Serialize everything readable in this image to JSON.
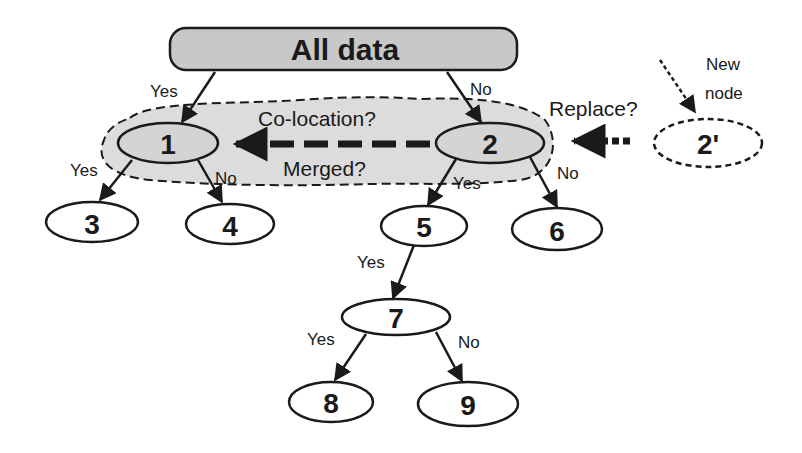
{
  "diagram": {
    "type": "decision-tree",
    "colors": {
      "root_fill": "#c8c8c8",
      "cloud_fill": "#dcdcdc",
      "node_fill_shaded": "#d4d4d4",
      "node_fill": "#ffffff",
      "stroke": "#1a1a1a"
    },
    "root": {
      "label": "All data"
    },
    "nodes": [
      {
        "id": "1",
        "label": "1"
      },
      {
        "id": "2",
        "label": "2"
      },
      {
        "id": "3",
        "label": "3"
      },
      {
        "id": "4",
        "label": "4"
      },
      {
        "id": "5",
        "label": "5"
      },
      {
        "id": "6",
        "label": "6"
      },
      {
        "id": "7",
        "label": "7"
      },
      {
        "id": "8",
        "label": "8"
      },
      {
        "id": "9",
        "label": "9"
      },
      {
        "id": "2prime",
        "label": "2'"
      }
    ],
    "edges": [
      {
        "from": "root",
        "to": "1",
        "label": "Yes"
      },
      {
        "from": "root",
        "to": "2",
        "label": "No"
      },
      {
        "from": "1",
        "to": "3",
        "label": "Yes"
      },
      {
        "from": "1",
        "to": "4",
        "label": "No"
      },
      {
        "from": "2",
        "to": "5",
        "label": "Yes"
      },
      {
        "from": "2",
        "to": "6",
        "label": "No"
      },
      {
        "from": "5",
        "to": "7",
        "label": "Yes"
      },
      {
        "from": "7",
        "to": "8",
        "label": "Yes"
      },
      {
        "from": "7",
        "to": "9",
        "label": "No"
      }
    ],
    "annotations": {
      "colocation": "Co-location?",
      "merged": "Merged?",
      "replace": "Replace?",
      "new_node_line1": "New",
      "new_node_line2": "node"
    }
  }
}
